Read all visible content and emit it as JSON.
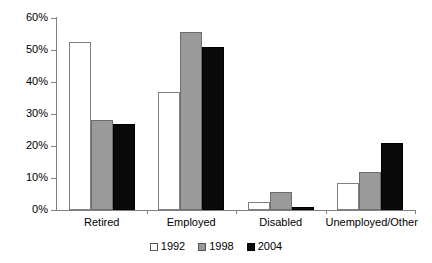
{
  "chart_data": {
    "type": "bar",
    "title": "",
    "xlabel": "",
    "ylabel": "",
    "ylim": [
      0,
      60
    ],
    "ytick_labels": [
      "0%",
      "10%",
      "20%",
      "30%",
      "40%",
      "50%",
      "60%"
    ],
    "ytick_values": [
      0,
      10,
      20,
      30,
      40,
      50,
      60
    ],
    "grid": false,
    "legend_position": "bottom-center",
    "categories": [
      "Retired",
      "Employed",
      "Disabled",
      "Unemployed/Other"
    ],
    "series": [
      {
        "name": "1992",
        "color": "#ffffff",
        "values": [
          52.5,
          37.0,
          2.5,
          8.5
        ]
      },
      {
        "name": "1998",
        "color": "#9a9a9a",
        "values": [
          28.0,
          55.5,
          5.5,
          12.0
        ]
      },
      {
        "name": "2004",
        "color": "#0a0a0a",
        "values": [
          27.0,
          51.0,
          1.0,
          21.0
        ]
      }
    ]
  },
  "axis": {
    "stroke_color": "#808080"
  }
}
